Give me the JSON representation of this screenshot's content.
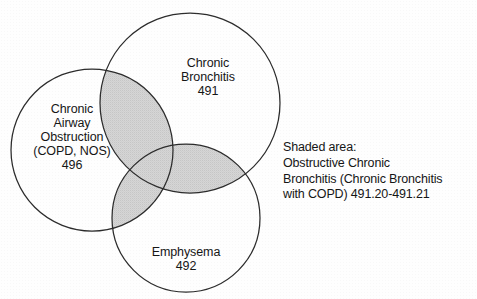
{
  "figure": {
    "type": "venn-diagram",
    "sets": [
      {
        "id": "copd",
        "name": "Chronic Airway Obstruction",
        "label": "Chronic\nAirway\nObstruction\n(COPD, NOS)",
        "code": "496",
        "position": "left"
      },
      {
        "id": "chronic-bronchitis",
        "name": "Chronic Bronchitis",
        "label": "Chronic\nBronchitis",
        "code": "491",
        "position": "top-right"
      },
      {
        "id": "emphysema",
        "name": "Emphysema",
        "label": "Emphysema",
        "code": "492",
        "position": "bottom"
      }
    ],
    "legend": {
      "line1": "Shaded area:",
      "line2": "Obstructive Chronic",
      "line3": "Bronchitis (Chronic Bronchitis",
      "line4": "with COPD) 491.20-491.21"
    },
    "colors": {
      "stroke": "#2b2b2b",
      "shade_fill": "#d4d4d4",
      "background": "#ffffff",
      "text": "#161616"
    }
  }
}
